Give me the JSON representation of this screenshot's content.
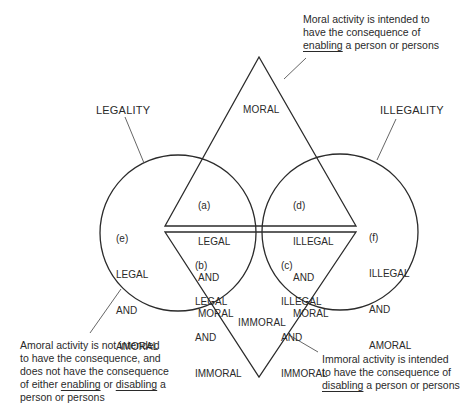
{
  "headings": {
    "legality": "LEGALITY",
    "illegality": "ILLEGALITY",
    "moral": "MORAL",
    "immoral": "IMMORAL"
  },
  "regions": {
    "a": {
      "tag": "(a)",
      "l1": "LEGAL",
      "l2": "AND",
      "l3": "MORAL"
    },
    "b": {
      "tag": "(b)",
      "l1": "LEGAL",
      "l2": "AND",
      "l3": "IMMORAL"
    },
    "c": {
      "tag": "(c)",
      "l1": "ILLEGAL",
      "l2": "AND",
      "l3": "IMMORAL"
    },
    "d": {
      "tag": "(d)",
      "l1": "ILLEGAL",
      "l2": "AND",
      "l3": "MORAL"
    },
    "e": {
      "tag": "(e)",
      "l1": "LEGAL",
      "l2": "AND",
      "l3": "AMORAL"
    },
    "f": {
      "tag": "(f)",
      "l1": "ILLEGAL",
      "l2": "AND",
      "l3": "AMORAL"
    }
  },
  "notes": {
    "moral": {
      "line1": "Moral activity is intended to",
      "line2": "have the consequence of",
      "line3_u": "enabling",
      "line3_rest": " a person or persons"
    },
    "amoral": {
      "line1": "Amoral activity is not intended",
      "line2": "to have the consequence, and",
      "line3": "does not have the consequence",
      "line4_pre": "of either ",
      "line4_u1": "enabling",
      "line4_mid": " or ",
      "line4_u2": "disabling",
      "line4_post": " a",
      "line5": "person or persons"
    },
    "immoral": {
      "line1": "Immoral activity is intended",
      "line2": "to have the consequence of",
      "line3_u": "disabling",
      "line3_rest": " a person or persons"
    }
  },
  "colors": {
    "stroke": "#2b2b2b",
    "text": "#2a2a2a",
    "background": "#ffffff"
  }
}
